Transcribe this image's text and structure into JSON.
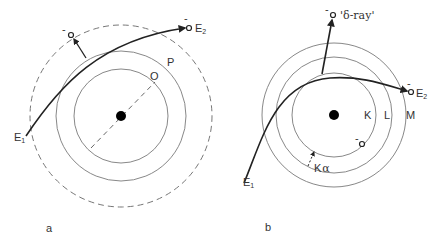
{
  "figure": {
    "panels": [
      {
        "id": "a",
        "caption": "a",
        "shells": [
          {
            "label": "O",
            "style": "solid"
          },
          {
            "label": "P",
            "style": "solid"
          },
          {
            "label": "",
            "style": "dashed"
          }
        ],
        "incident_label": "E",
        "incident_sub": "1",
        "outgoing_label": "E",
        "outgoing_sub": "2",
        "ejected_charge": "-",
        "outgoing_charge": "-"
      },
      {
        "id": "b",
        "caption": "b",
        "shells": [
          {
            "label": "K",
            "style": "solid"
          },
          {
            "label": "L",
            "style": "solid"
          },
          {
            "label": "M",
            "style": "solid"
          }
        ],
        "incident_label": "E",
        "incident_sub": "1",
        "outgoing_label": "E",
        "outgoing_sub": "2",
        "delta_ray_label": "'δ-ray'",
        "delta_charge": "-",
        "outgoing_charge": "-",
        "vacancy_charge": "-",
        "xray_label": "K",
        "xray_sub": "α"
      }
    ],
    "colors": {
      "line": "#8a8a8a",
      "trajectory": "#222222",
      "nucleus": "#000000",
      "text": "#333333"
    }
  }
}
